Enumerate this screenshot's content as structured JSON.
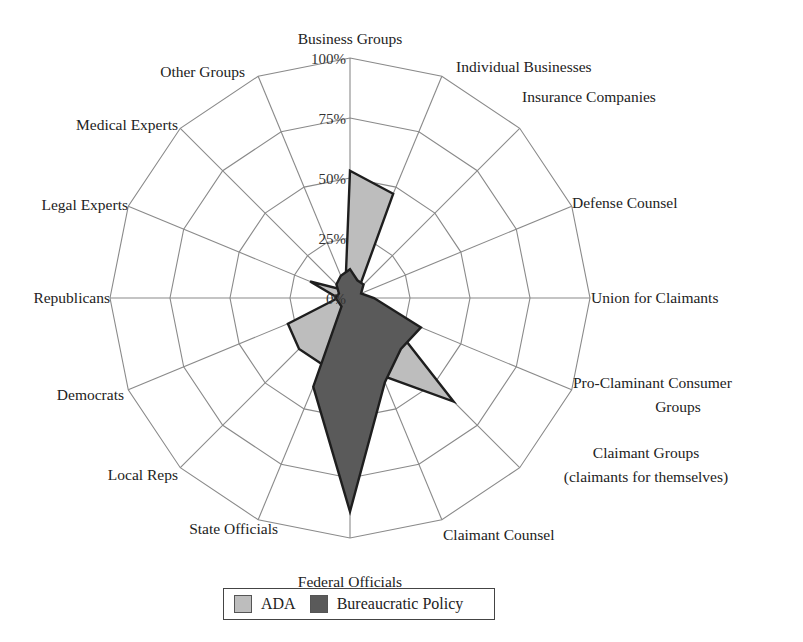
{
  "chart_data": {
    "type": "radar",
    "title": "",
    "categories": [
      "Business Groups",
      "Individual Businesses",
      "Insurance Companies",
      "Defense Counsel",
      "Union for Claimants",
      "Pro-Claminant Consumer Groups",
      "Claimant Groups (claimants for themselves)",
      "Claimant Counsel",
      "Federal Officials",
      "State Officials",
      "Local Reps",
      "Democrats",
      "Republicans",
      "Legal Experts",
      "Medical Experts",
      "Other Groups"
    ],
    "series": [
      {
        "name": "ADA",
        "color": "#bdbdbd",
        "values": [
          53,
          47,
          5,
          4,
          3,
          15,
          61,
          35,
          38,
          30,
          30,
          28,
          5,
          18,
          5,
          5
        ]
      },
      {
        "name": "Bureaucratic Policy",
        "color": "#5a5a5a",
        "values": [
          12,
          8,
          8,
          5,
          10,
          32,
          30,
          38,
          89,
          40,
          5,
          5,
          6,
          5,
          8,
          10
        ]
      }
    ],
    "radial_ticks": [
      "0%",
      "25%",
      "50%",
      "75%",
      "100%"
    ],
    "range": [
      0,
      100
    ],
    "grid": true,
    "legend_position": "bottom"
  },
  "labels": {
    "axis": [
      {
        "lines": [
          "Business Groups"
        ]
      },
      {
        "lines": [
          "Individual Businesses"
        ]
      },
      {
        "lines": [
          "Insurance Companies"
        ]
      },
      {
        "lines": [
          "Defense Counsel"
        ]
      },
      {
        "lines": [
          "Union for Claimants"
        ]
      },
      {
        "lines": [
          "Pro-Claminant Consumer",
          "Groups"
        ]
      },
      {
        "lines": [
          "Claimant Groups",
          "(claimants for themselves)"
        ]
      },
      {
        "lines": [
          "Claimant Counsel"
        ]
      },
      {
        "lines": [
          "Federal Officials"
        ]
      },
      {
        "lines": [
          "State Officials"
        ]
      },
      {
        "lines": [
          "Local Reps"
        ]
      },
      {
        "lines": [
          "Democrats"
        ]
      },
      {
        "lines": [
          "Republicans"
        ]
      },
      {
        "lines": [
          "Legal Experts"
        ]
      },
      {
        "lines": [
          "Medical Experts"
        ]
      },
      {
        "lines": [
          "Other  Groups"
        ]
      }
    ]
  },
  "legend": {
    "items": [
      {
        "label": "ADA",
        "color": "#bdbdbd"
      },
      {
        "label": "Bureaucratic Policy",
        "color": "#5a5a5a"
      }
    ]
  }
}
